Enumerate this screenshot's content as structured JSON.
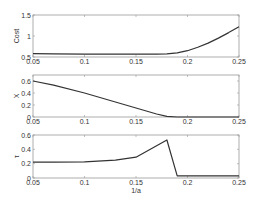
{
  "chart_data": [
    {
      "type": "line",
      "title": "",
      "xlabel": "",
      "ylabel": "Cost",
      "xlim": [
        0.05,
        0.25
      ],
      "ylim": [
        0.5,
        1.5
      ],
      "xticks": [
        "0.05",
        "0.1",
        "0.15",
        "0.2",
        "0.25"
      ],
      "yticks": [
        "0.5",
        "1",
        "1.5"
      ],
      "grid": false,
      "series": [
        {
          "name": "Cost",
          "x": [
            0.05,
            0.07,
            0.1,
            0.13,
            0.15,
            0.17,
            0.18,
            0.19,
            0.2,
            0.21,
            0.22,
            0.23,
            0.24,
            0.25
          ],
          "y": [
            0.58,
            0.575,
            0.57,
            0.57,
            0.57,
            0.57,
            0.575,
            0.6,
            0.65,
            0.73,
            0.83,
            0.95,
            1.08,
            1.22
          ]
        }
      ]
    },
    {
      "type": "line",
      "title": "",
      "xlabel": "",
      "ylabel": "X",
      "xlim": [
        0.05,
        0.25
      ],
      "ylim": [
        0,
        0.7
      ],
      "xticks": [
        "0.05",
        "0.1",
        "0.15",
        "0.2",
        "0.25"
      ],
      "yticks": [
        "0",
        "0.2",
        "0.4",
        "0.6"
      ],
      "grid": false,
      "series": [
        {
          "name": "X",
          "x": [
            0.05,
            0.07,
            0.1,
            0.13,
            0.15,
            0.17,
            0.18,
            0.19,
            0.2,
            0.25
          ],
          "y": [
            0.6,
            0.53,
            0.4,
            0.25,
            0.15,
            0.05,
            0.01,
            0.0,
            0.0,
            0.0
          ]
        }
      ]
    },
    {
      "type": "line",
      "title": "",
      "xlabel": "1/a",
      "ylabel": "τ",
      "xlim": [
        0.05,
        0.25
      ],
      "ylim": [
        0,
        0.6
      ],
      "xticks": [
        "0.05",
        "0.1",
        "0.15",
        "0.2",
        "0.25"
      ],
      "yticks": [
        "0",
        "0.2",
        "0.4",
        "0.6"
      ],
      "grid": false,
      "series": [
        {
          "name": "tau",
          "x": [
            0.05,
            0.07,
            0.1,
            0.13,
            0.15,
            0.18,
            0.19,
            0.2,
            0.25
          ],
          "y": [
            0.22,
            0.22,
            0.225,
            0.25,
            0.29,
            0.53,
            0.03,
            0.03,
            0.03
          ]
        }
      ]
    }
  ],
  "style": {
    "line_color": "#333333",
    "axis_color": "#999999"
  }
}
